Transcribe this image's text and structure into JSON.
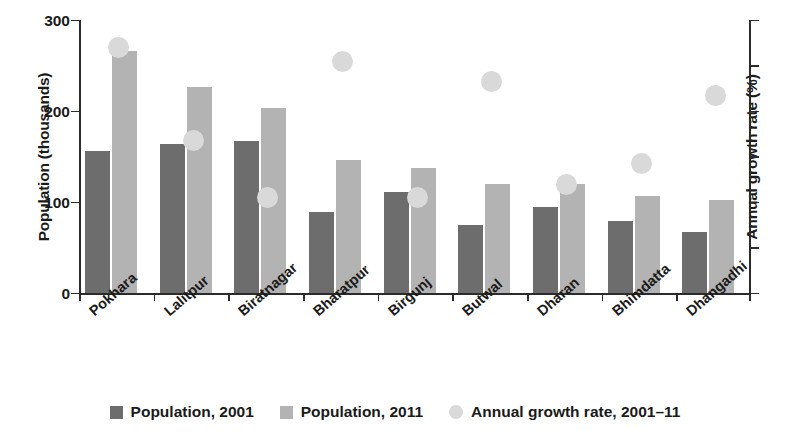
{
  "chart_data": {
    "type": "bar",
    "title": "",
    "subtitle": "",
    "xlabel": "",
    "ylabel": "Population (thousands)",
    "y2label": "Annual growth rate (%)",
    "grid": false,
    "legend_position": "bottom",
    "ylim": [
      0,
      300
    ],
    "y2lim": [
      0,
      6
    ],
    "yticks": [
      "0",
      "100",
      "200",
      "300"
    ],
    "ytick_values": [
      0,
      100,
      200,
      300
    ],
    "y2ticks": [
      "0",
      "1",
      "2",
      "3",
      "4",
      "5",
      "6"
    ],
    "y2tick_values": [
      0,
      1,
      2,
      3,
      4,
      5,
      6
    ],
    "categories": [
      "Pokhara",
      "Lalitpur",
      "Biratnagar",
      "Bharatpur",
      "Birgunj",
      "Butwal",
      "Dharan",
      "Bhimdatta",
      "Dhangadhi"
    ],
    "series": [
      {
        "name": "Population, 2001",
        "kind": "bar",
        "axis": "left",
        "color": "#6d6d6d",
        "values": [
          156,
          164,
          167,
          89,
          111,
          75,
          95,
          80,
          67
        ]
      },
      {
        "name": "Population, 2011",
        "kind": "bar",
        "axis": "left",
        "color": "#b3b3b3",
        "values": [
          266,
          227,
          204,
          147,
          138,
          120,
          120,
          107,
          103
        ]
      },
      {
        "name": "Annual growth rate, 2001–11",
        "kind": "scatter",
        "axis": "right",
        "color": "#d9d9d9",
        "values": [
          5.4,
          3.35,
          2.1,
          5.1,
          2.1,
          4.65,
          2.4,
          2.85,
          4.35
        ]
      }
    ]
  },
  "legend": {
    "items": [
      {
        "label": "Population, 2001",
        "marker": "square",
        "color": "#6d6d6d"
      },
      {
        "label": "Population, 2011",
        "marker": "square",
        "color": "#b3b3b3"
      },
      {
        "label": "Annual growth rate, 2001–11",
        "marker": "circle",
        "color": "#d9d9d9"
      }
    ]
  }
}
